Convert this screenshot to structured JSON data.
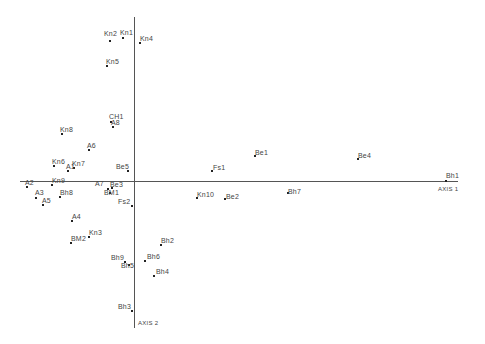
{
  "chart_data": {
    "type": "scatter",
    "title": "",
    "xlabel": "AXIS 1",
    "ylabel": "AXIS 2",
    "grid": false,
    "legend": null,
    "origin_px": {
      "x": 134,
      "y": 181
    },
    "axes_px": {
      "x_axis": {
        "x1": 20,
        "x2": 458,
        "y": 181
      },
      "y_axis": {
        "x": 134,
        "y1": 17,
        "y2": 328
      }
    },
    "points": [
      {
        "label": "Kn1",
        "x": -11,
        "y": 143,
        "lx": 120,
        "ly": 33,
        "lpos": "above"
      },
      {
        "label": "Kn2",
        "x": -24,
        "y": 140,
        "lx": 104,
        "ly": 34,
        "lpos": "above"
      },
      {
        "label": "Kn4",
        "x": 6,
        "y": 138,
        "lx": 140,
        "ly": 39,
        "lpos": "right"
      },
      {
        "label": "Kn5",
        "x": -27,
        "y": 115,
        "lx": 106,
        "ly": 62,
        "lpos": "right"
      },
      {
        "label": "CH1",
        "x": -23,
        "y": 59,
        "lx": 109,
        "ly": 117,
        "lpos": "right"
      },
      {
        "label": "A8",
        "x": -21,
        "y": 54,
        "lx": 111,
        "ly": 123,
        "lpos": "right"
      },
      {
        "label": "Kn8",
        "x": -72,
        "y": 47,
        "lx": 60,
        "ly": 130,
        "lpos": "right"
      },
      {
        "label": "A6",
        "x": -45,
        "y": 31,
        "lx": 87,
        "ly": 146,
        "lpos": "right"
      },
      {
        "label": "Kn6",
        "x": -80,
        "y": 15,
        "lx": 52,
        "ly": 162,
        "lpos": "right"
      },
      {
        "label": "Kn7",
        "x": -60,
        "y": 13,
        "lx": 72,
        "ly": 164,
        "lpos": "right"
      },
      {
        "label": "A1",
        "x": -66,
        "y": 10,
        "lx": 66,
        "ly": 167,
        "lpos": "right"
      },
      {
        "label": "Be5",
        "x": -6,
        "y": 10,
        "lx": 116,
        "ly": 167,
        "lpos": "left"
      },
      {
        "label": "A2",
        "x": -107,
        "y": -6,
        "lx": 25,
        "ly": 183,
        "lpos": "right"
      },
      {
        "label": "Kn9",
        "x": -82,
        "y": -4,
        "lx": 52,
        "ly": 181,
        "lpos": "right"
      },
      {
        "label": "A7",
        "x": -22,
        "y": -7,
        "lx": 95,
        "ly": 184,
        "lpos": "left"
      },
      {
        "label": "Be3",
        "x": -26,
        "y": -8,
        "lx": 110,
        "ly": 185,
        "lpos": "right"
      },
      {
        "label": "BM1",
        "x": -24,
        "y": -12,
        "lx": 104,
        "ly": 193,
        "lpos": "below"
      },
      {
        "label": "A3",
        "x": -98,
        "y": -17,
        "lx": 35,
        "ly": 193,
        "lpos": "right"
      },
      {
        "label": "Bh8",
        "x": -74,
        "y": -16,
        "lx": 60,
        "ly": 193,
        "lpos": "right"
      },
      {
        "label": "A5",
        "x": -91,
        "y": -24,
        "lx": 42,
        "ly": 201,
        "lpos": "right"
      },
      {
        "label": "Fs2",
        "x": -2,
        "y": -25,
        "lx": 118,
        "ly": 202,
        "lpos": "left"
      },
      {
        "label": "A4",
        "x": -62,
        "y": -40,
        "lx": 72,
        "ly": 217,
        "lpos": "right"
      },
      {
        "label": "Kn3",
        "x": -45,
        "y": -56,
        "lx": 89,
        "ly": 233,
        "lpos": "right"
      },
      {
        "label": "BM2",
        "x": -63,
        "y": -62,
        "lx": 71,
        "ly": 239,
        "lpos": "right"
      },
      {
        "label": "Bh2",
        "x": 27,
        "y": -64,
        "lx": 161,
        "ly": 241,
        "lpos": "right"
      },
      {
        "label": "Bh9",
        "x": -9,
        "y": -81,
        "lx": 111,
        "ly": 258,
        "lpos": "left"
      },
      {
        "label": "Bh6",
        "x": 11,
        "y": -80,
        "lx": 147,
        "ly": 257,
        "lpos": "right"
      },
      {
        "label": "Bh5",
        "x": -5,
        "y": -84,
        "lx": 121,
        "ly": 266,
        "lpos": "below"
      },
      {
        "label": "Bh4",
        "x": 20,
        "y": -95,
        "lx": 156,
        "ly": 272,
        "lpos": "right"
      },
      {
        "label": "Bh3",
        "x": -2,
        "y": -130,
        "lx": 118,
        "ly": 307,
        "lpos": "left"
      },
      {
        "label": "Fs1",
        "x": 78,
        "y": 10,
        "lx": 213,
        "ly": 168,
        "lpos": "right"
      },
      {
        "label": "Be1",
        "x": 121,
        "y": 25,
        "lx": 255,
        "ly": 153,
        "lpos": "right"
      },
      {
        "label": "Be4",
        "x": 224,
        "y": 22,
        "lx": 358,
        "ly": 156,
        "lpos": "right"
      },
      {
        "label": "Kn10",
        "x": 63,
        "y": -17,
        "lx": 197,
        "ly": 195,
        "lpos": "right"
      },
      {
        "label": "Be2",
        "x": 91,
        "y": -18,
        "lx": 226,
        "ly": 197,
        "lpos": "right"
      },
      {
        "label": "Bh7",
        "x": 154,
        "y": -12,
        "lx": 288,
        "ly": 192,
        "lpos": "right"
      },
      {
        "label": "Bh1",
        "x": 312,
        "y": 0,
        "lx": 446,
        "ly": 176,
        "lpos": "above"
      }
    ]
  },
  "labels": {
    "axis1": "AXIS 1",
    "axis2": "AXIS 2"
  }
}
